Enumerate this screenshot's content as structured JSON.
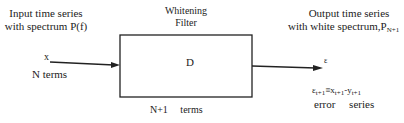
{
  "input": {
    "title_line1": "Input time series",
    "title_line2": "with spectrum P(f)",
    "signal_label": "x",
    "terms_label": "N terms"
  },
  "filter": {
    "title_line1": "Whitening",
    "title_line2": "Filter",
    "box_label": "D",
    "terms_label": "N+1     terms"
  },
  "output": {
    "title_line1": "Output time series",
    "title_line2_prefix": "with white spectrum,P",
    "title_line2_sub": "N+1",
    "signal_label": "ε",
    "equation": {
      "lhs": "ε",
      "lhs_sub": "t+1",
      "eq": "≡",
      "x": "x",
      "x_sub": "t+1",
      "minus": "-",
      "y": "y",
      "y_sub": "t+1"
    },
    "error_label": "error     series"
  },
  "colors": {
    "stroke": "#222222",
    "background": "#ffffff"
  }
}
